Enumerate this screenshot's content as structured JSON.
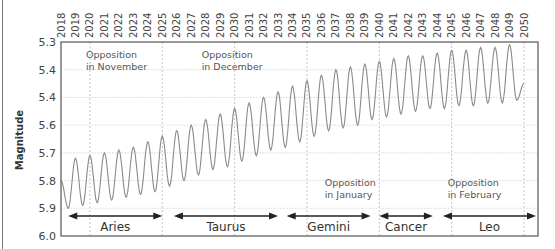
{
  "chart_data": {
    "type": "line",
    "title": "",
    "xlabel": "",
    "ylabel": "Magnitude",
    "x_ticks": [
      "2018",
      "2019",
      "2020",
      "2021",
      "2022",
      "2023",
      "2024",
      "2025",
      "2026",
      "2027",
      "2028",
      "2029",
      "2030",
      "2031",
      "2032",
      "2033",
      "2034",
      "2035",
      "2036",
      "2037",
      "2038",
      "2039",
      "2040",
      "2041",
      "2042",
      "2043",
      "2044",
      "2045",
      "2046",
      "2047",
      "2048",
      "2049",
      "2050"
    ],
    "x_range": [
      2018,
      2050
    ],
    "y_ticks": [
      "5.3",
      "5.4",
      "5.4",
      "5.6",
      "5.7",
      "5.8",
      "5.9",
      "6.0"
    ],
    "y_range": [
      5.3,
      6.0
    ],
    "y_inverted": true,
    "grid": true,
    "series": [
      {
        "name": "Uranus magnitude (annual oscillation)",
        "color": "#8a8a8a",
        "peaks": {
          "x": [
            2019.0,
            2020.0,
            2021.0,
            2022.0,
            2023.0,
            2024.0,
            2025.0,
            2026.0,
            2027.0,
            2028.0,
            2029.0,
            2030.0,
            2031.0,
            2032.0,
            2033.0,
            2034.0,
            2035.0,
            2036.0,
            2037.0,
            2038.0,
            2039.0,
            2040.0,
            2041.0,
            2042.0,
            2043.0,
            2044.0,
            2045.0,
            2046.0,
            2047.0,
            2048.0,
            2049.0
          ],
          "values": [
            5.72,
            5.71,
            5.7,
            5.69,
            5.68,
            5.66,
            5.64,
            5.62,
            5.6,
            5.58,
            5.56,
            5.54,
            5.52,
            5.5,
            5.48,
            5.46,
            5.44,
            5.42,
            5.4,
            5.39,
            5.38,
            5.37,
            5.36,
            5.35,
            5.35,
            5.34,
            5.33,
            5.33,
            5.32,
            5.32,
            5.31
          ]
        },
        "troughs": {
          "x": [
            2018.5,
            2019.5,
            2020.5,
            2021.5,
            2022.5,
            2023.5,
            2024.5,
            2025.5,
            2026.5,
            2027.5,
            2028.5,
            2029.5,
            2030.5,
            2031.5,
            2032.5,
            2033.5,
            2034.5,
            2035.5,
            2036.5,
            2037.5,
            2038.5,
            2039.5,
            2040.5,
            2041.5,
            2042.5,
            2043.5,
            2044.5,
            2045.5,
            2046.5,
            2047.5,
            2048.5,
            2049.5
          ],
          "values": [
            5.9,
            5.89,
            5.88,
            5.87,
            5.86,
            5.85,
            5.84,
            5.82,
            5.8,
            5.78,
            5.76,
            5.75,
            5.73,
            5.71,
            5.69,
            5.68,
            5.66,
            5.64,
            5.62,
            5.61,
            5.6,
            5.58,
            5.57,
            5.56,
            5.55,
            5.54,
            5.54,
            5.53,
            5.53,
            5.52,
            5.52,
            5.51
          ]
        },
        "start_value": 5.8,
        "end_value": 5.45
      }
    ],
    "annotations": [
      {
        "text_line1": "Opposition",
        "text_line2": "in November",
        "x": 2020,
        "y": 5.38
      },
      {
        "text_line1": "Opposition",
        "text_line2": "in December",
        "x": 2028,
        "y": 5.38
      },
      {
        "text_line1": "Opposition",
        "text_line2": "in January",
        "x": 2036.5,
        "y": 5.84
      },
      {
        "text_line1": "Opposition",
        "text_line2": "in February",
        "x": 2045,
        "y": 5.84
      }
    ],
    "constellations": [
      {
        "name": "Aries",
        "from": 2018.5,
        "to": 2025.0
      },
      {
        "name": "Taurus",
        "from": 2025.8,
        "to": 2033.0
      },
      {
        "name": "Gemini",
        "from": 2033.6,
        "to": 2039.4
      },
      {
        "name": "Cancer",
        "from": 2040.0,
        "to": 2043.7
      },
      {
        "name": "Leo",
        "from": 2044.4,
        "to": 2050.9
      }
    ],
    "dashed_vertical_lines": [
      2020,
      2025,
      2030,
      2035,
      2040,
      2045,
      2050
    ]
  }
}
